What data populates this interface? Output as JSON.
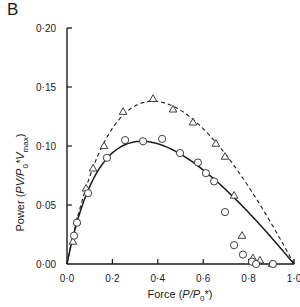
{
  "panel_label": "B",
  "axes": {
    "x_label_prefix": "Force (",
    "x_label_var": "P/P",
    "x_label_sub": "0",
    "x_label_suffix": "*)",
    "y_label_prefix": "Power (",
    "y_label_var": "PV/P",
    "y_label_sub0": "0",
    "y_label_mid": "*V",
    "y_label_sub1": "max",
    "y_label_suffix": ")"
  },
  "chart_data": {
    "type": "scatter",
    "title": "",
    "panel": "B",
    "xlabel": "Force (P/P0*)",
    "ylabel": "Power (PV/P0*Vmax)",
    "xlim": [
      0.0,
      1.0
    ],
    "ylim": [
      0.0,
      0.2
    ],
    "x_ticks": [
      "0·0",
      "0·2",
      "0·4",
      "0·6",
      "0·8",
      "1·0"
    ],
    "y_ticks": [
      "0·00",
      "0·05",
      "0·10",
      "0·15",
      "0·20"
    ],
    "grid": false,
    "legend": null,
    "series": [
      {
        "name": "triangles (dashed fit)",
        "marker": "triangle-open",
        "fit_line": "dashed",
        "points": [
          [
            0.026,
            0.019
          ],
          [
            0.044,
            0.036
          ],
          [
            0.084,
            0.064
          ],
          [
            0.115,
            0.081
          ],
          [
            0.163,
            0.1
          ],
          [
            0.247,
            0.129
          ],
          [
            0.379,
            0.14
          ],
          [
            0.467,
            0.131
          ],
          [
            0.555,
            0.12
          ],
          [
            0.656,
            0.102
          ],
          [
            0.696,
            0.091
          ],
          [
            0.736,
            0.058
          ],
          [
            0.771,
            0.024
          ],
          [
            0.819,
            0.005
          ],
          [
            0.85,
            0.003
          ],
          [
            0.903,
            0.0
          ]
        ],
        "fit_peak": [
          0.38,
          0.138
        ]
      },
      {
        "name": "circles (solid fit)",
        "marker": "circle-open",
        "fit_line": "solid",
        "points": [
          [
            0.031,
            0.024
          ],
          [
            0.044,
            0.035
          ],
          [
            0.093,
            0.06
          ],
          [
            0.176,
            0.09
          ],
          [
            0.256,
            0.105
          ],
          [
            0.335,
            0.104
          ],
          [
            0.419,
            0.106
          ],
          [
            0.498,
            0.094
          ],
          [
            0.577,
            0.086
          ],
          [
            0.612,
            0.077
          ],
          [
            0.648,
            0.07
          ],
          [
            0.696,
            0.044
          ],
          [
            0.736,
            0.016
          ],
          [
            0.775,
            0.008
          ],
          [
            0.815,
            0.002
          ],
          [
            0.833,
            0.0
          ],
          [
            0.907,
            0.0
          ]
        ],
        "fit_peak": [
          0.33,
          0.104
        ]
      }
    ]
  }
}
